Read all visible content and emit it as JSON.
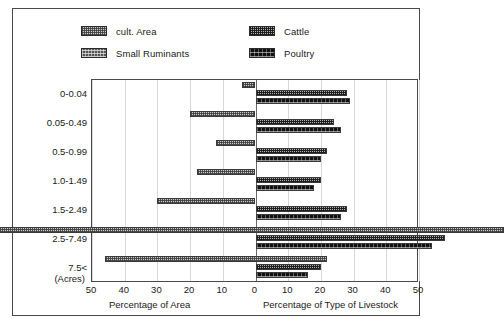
{
  "legend": {
    "items": [
      {
        "label": "cult. Area",
        "pattern": "p-cult",
        "key": "cult_area"
      },
      {
        "label": "Small Ruminants",
        "pattern": "p-small",
        "key": "small_ruminants"
      },
      {
        "label": "Cattle",
        "pattern": "p-cattle",
        "key": "cattle"
      },
      {
        "label": "Poultry",
        "pattern": "p-poultry",
        "key": "poultry"
      }
    ]
  },
  "axis": {
    "unit_label": "(Acres)",
    "left_title": "Percentage of Area",
    "right_title": "Percentage of Type of Livestock",
    "ticks": [
      {
        "value": -50,
        "label": "50"
      },
      {
        "value": -40,
        "label": "40"
      },
      {
        "value": -30,
        "label": "30"
      },
      {
        "value": -20,
        "label": "20"
      },
      {
        "value": -10,
        "label": "10"
      },
      {
        "value": 0,
        "label": "0"
      },
      {
        "value": 10,
        "label": "10"
      },
      {
        "value": 20,
        "label": "20"
      },
      {
        "value": 30,
        "label": "30"
      },
      {
        "value": 40,
        "label": "40"
      },
      {
        "value": 50,
        "label": "50"
      }
    ]
  },
  "colors": {
    "cult_area": "#c9c9c9",
    "small_ruminants": "#555555",
    "cattle": "#b0b0b0",
    "poultry": "#111111",
    "axis": "#4a4a4a",
    "grid": "#d8d8d8"
  },
  "chart_data": {
    "type": "bar",
    "title": "",
    "orientation": "horizontal",
    "layout": "diverging-pyramid",
    "xlabel_left": "Percentage of Area",
    "xlabel_right": "Percentage of Type of Livestock",
    "ylabel": "(Acres)",
    "xlim": [
      -50,
      50
    ],
    "xtick_labels": [
      "50",
      "40",
      "30",
      "20",
      "10",
      "0",
      "10",
      "20",
      "30",
      "40",
      "50"
    ],
    "grid": true,
    "legend_position": "top",
    "categories": [
      "0-0.04",
      "0.05-0.49",
      "0.5-0.99",
      "1.0-1.49",
      "1.5-2.49",
      "2.5-7.49",
      "7.5<"
    ],
    "series": [
      {
        "name": "cult. Area",
        "side": "both",
        "left_values": [
          2,
          10,
          6,
          9,
          15,
          45,
          23
        ],
        "right_values": [
          0,
          0,
          0,
          0,
          0,
          38,
          11
        ]
      },
      {
        "name": "Cattle",
        "side": "right",
        "values": [
          14,
          12,
          11,
          10,
          14,
          29,
          10
        ]
      },
      {
        "name": "Poultry",
        "side": "right",
        "values": [
          14.5,
          13,
          10,
          9,
          13,
          27,
          8
        ]
      },
      {
        "name": "Small Ruminants",
        "side": "right",
        "values": [
          0,
          0,
          0,
          0,
          0,
          0,
          0
        ]
      }
    ]
  }
}
